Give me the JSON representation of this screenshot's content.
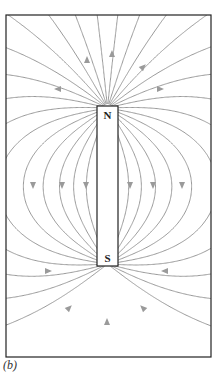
{
  "figure": {
    "caption": "(b)",
    "frame": {
      "x": 6,
      "y": 15,
      "width": 205,
      "height": 342
    },
    "magnet": {
      "x": 97,
      "y": 106,
      "width": 21,
      "height": 160,
      "north_label": "N",
      "south_label": "S"
    },
    "colors": {
      "field_line": "#9a9a9a",
      "frame": "#222222",
      "magnet_border": "#222222",
      "label": "#222222"
    },
    "arrows": [
      {
        "x": 87,
        "y": 60,
        "direction": "up"
      },
      {
        "x": 112,
        "y": 54,
        "direction": "up"
      },
      {
        "x": 143,
        "y": 67,
        "direction": "up-right"
      },
      {
        "x": 58,
        "y": 89,
        "direction": "left"
      },
      {
        "x": 160,
        "y": 89,
        "direction": "right"
      },
      {
        "x": 33,
        "y": 185,
        "direction": "down"
      },
      {
        "x": 62,
        "y": 185,
        "direction": "down"
      },
      {
        "x": 86,
        "y": 185,
        "direction": "down"
      },
      {
        "x": 130,
        "y": 185,
        "direction": "down"
      },
      {
        "x": 153,
        "y": 185,
        "direction": "down"
      },
      {
        "x": 182,
        "y": 185,
        "direction": "down"
      },
      {
        "x": 48,
        "y": 271,
        "direction": "right"
      },
      {
        "x": 165,
        "y": 271,
        "direction": "left"
      },
      {
        "x": 69,
        "y": 308,
        "direction": "up-right"
      },
      {
        "x": 143,
        "y": 308,
        "direction": "up-left"
      },
      {
        "x": 107,
        "y": 322,
        "direction": "up"
      }
    ]
  }
}
